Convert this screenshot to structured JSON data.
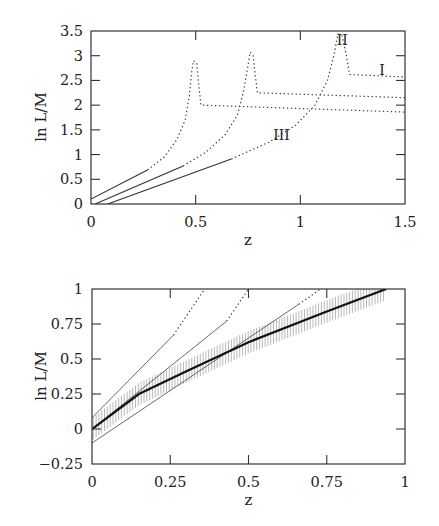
{
  "chart_data": [
    {
      "type": "line",
      "title": "",
      "xlabel": "z",
      "ylabel": "ln L/M",
      "xlim": [
        0,
        1.5
      ],
      "ylim": [
        0,
        3.5
      ],
      "xticks": [
        0,
        0.5,
        1,
        1.5
      ],
      "xtick_labels": [
        "0",
        "0.5",
        "1",
        "1.5"
      ],
      "yticks": [
        0,
        0.5,
        1,
        1.5,
        2,
        2.5,
        3,
        3.5
      ],
      "ytick_labels": [
        "0",
        "0.5",
        "1",
        "1.5",
        "2",
        "2.5",
        "3",
        "3.5"
      ],
      "grid": false,
      "series": [
        {
          "name": "A",
          "solid": [
            [
              0,
              0.1
            ],
            [
              0.27,
              0.69
            ]
          ],
          "dotted": [
            [
              0.27,
              0.69
            ],
            [
              0.35,
              0.95
            ],
            [
              0.41,
              1.3
            ],
            [
              0.45,
              1.7
            ],
            [
              0.47,
              2.2
            ],
            [
              0.48,
              2.65
            ],
            [
              0.49,
              2.9
            ],
            [
              0.505,
              2.85
            ],
            [
              0.515,
              2.4
            ],
            [
              0.525,
              2.0
            ],
            [
              1.5,
              1.86
            ]
          ]
        },
        {
          "name": "B",
          "solid": [
            [
              0.02,
              0.0
            ],
            [
              0.44,
              0.77
            ]
          ],
          "dotted": [
            [
              0.44,
              0.77
            ],
            [
              0.55,
              1.05
            ],
            [
              0.64,
              1.4
            ],
            [
              0.7,
              1.8
            ],
            [
              0.73,
              2.3
            ],
            [
              0.75,
              2.8
            ],
            [
              0.76,
              3.07
            ],
            [
              0.775,
              3.0
            ],
            [
              0.785,
              2.6
            ],
            [
              0.795,
              2.25
            ],
            [
              1.5,
              2.15
            ]
          ]
        },
        {
          "name": "C",
          "solid": [
            [
              0.08,
              0.0
            ],
            [
              0.67,
              0.91
            ]
          ],
          "dotted": [
            [
              0.67,
              0.91
            ],
            [
              0.85,
              1.25
            ],
            [
              0.98,
              1.6
            ],
            [
              1.07,
              2.0
            ],
            [
              1.13,
              2.5
            ],
            [
              1.16,
              3.0
            ],
            [
              1.18,
              3.44
            ],
            [
              1.2,
              3.4
            ],
            [
              1.22,
              3.0
            ],
            [
              1.235,
              2.62
            ],
            [
              1.5,
              2.57
            ]
          ]
        }
      ],
      "annotations": [
        {
          "text": "I",
          "x": 1.39,
          "y": 2.6
        },
        {
          "text": "II",
          "x": 1.2,
          "y": 3.22
        },
        {
          "text": "III",
          "x": 0.91,
          "y": 1.3
        }
      ]
    },
    {
      "type": "line",
      "title": "",
      "xlabel": "z",
      "ylabel": "ln L/M",
      "xlim": [
        0,
        1
      ],
      "ylim": [
        -0.25,
        1
      ],
      "xticks": [
        0,
        0.25,
        0.5,
        0.75,
        1
      ],
      "xtick_labels": [
        "0",
        "0.25",
        "0.5",
        "0.75",
        "1"
      ],
      "yticks": [
        -0.25,
        0,
        0.25,
        0.5,
        0.75,
        1
      ],
      "ytick_labels": [
        "−0.25",
        "0",
        "0.25",
        "0.5",
        "0.75",
        "1"
      ],
      "grid": false,
      "series": [
        {
          "name": "thin-1",
          "solid": [
            [
              0,
              0.08
            ],
            [
              0.26,
              0.67
            ]
          ],
          "dotted": [
            [
              0.26,
              0.67
            ],
            [
              0.36,
              1.0
            ]
          ]
        },
        {
          "name": "thin-2",
          "solid": [
            [
              0,
              0.0
            ],
            [
              0.43,
              0.77
            ]
          ],
          "dotted": [
            [
              0.43,
              0.77
            ],
            [
              0.5,
              1.0
            ]
          ]
        },
        {
          "name": "thin-3",
          "solid": [
            [
              0,
              -0.1
            ],
            [
              0.66,
              0.89
            ]
          ],
          "dotted": [
            [
              0.66,
              0.89
            ],
            [
              0.73,
              1.0
            ]
          ]
        },
        {
          "name": "mean-relation",
          "style": "thick",
          "points": [
            [
              0,
              0.0
            ],
            [
              0.15,
              0.25
            ],
            [
              0.3,
              0.41
            ],
            [
              0.5,
              0.62
            ],
            [
              0.75,
              0.84
            ],
            [
              0.94,
              1.0
            ]
          ]
        }
      ],
      "band": {
        "name": "uncertainty-band",
        "half_width": 0.08,
        "z_range": [
          0,
          0.94
        ]
      }
    }
  ]
}
